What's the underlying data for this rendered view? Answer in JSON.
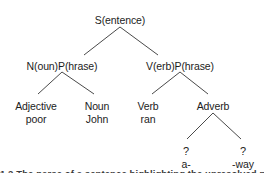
{
  "diagram": {
    "type": "syntax-parse-tree",
    "title": "",
    "colors": {
      "background": "#ffffff",
      "text": "#1c1c1c",
      "edge": "#4a4a4a"
    },
    "nodes": [
      {
        "id": "s",
        "label": "S(entence)",
        "word": "",
        "x": 120,
        "y": 14
      },
      {
        "id": "np",
        "label": "N(oun)P(hrase)",
        "word": "",
        "x": 62,
        "y": 60
      },
      {
        "id": "vp",
        "label": "V(erb)P(hrase)",
        "word": "",
        "x": 180,
        "y": 60
      },
      {
        "id": "adjective",
        "label": "Adjective",
        "word": "poor",
        "x": 36,
        "y": 100
      },
      {
        "id": "noun",
        "label": "Noun",
        "word": "John",
        "x": 97,
        "y": 100
      },
      {
        "id": "verb",
        "label": "Verb",
        "word": "ran",
        "x": 148,
        "y": 100
      },
      {
        "id": "adverb",
        "label": "Adverb",
        "word": "",
        "x": 213,
        "y": 100
      },
      {
        "id": "affix-a",
        "label": "?",
        "word": "a-",
        "x": 186,
        "y": 145
      },
      {
        "id": "affix-way",
        "label": "?",
        "word": "-way",
        "x": 243,
        "y": 145
      }
    ],
    "edges": [
      {
        "from": "s",
        "to": "np",
        "x1": 120,
        "y1": 27,
        "x2": 84,
        "y2": 55
      },
      {
        "from": "s",
        "to": "vp",
        "x1": 120,
        "y1": 27,
        "x2": 158,
        "y2": 55
      },
      {
        "from": "np",
        "to": "adjective",
        "x1": 62,
        "y1": 72,
        "x2": 38,
        "y2": 94
      },
      {
        "from": "np",
        "to": "noun",
        "x1": 62,
        "y1": 72,
        "x2": 94,
        "y2": 94
      },
      {
        "from": "vp",
        "to": "verb",
        "x1": 180,
        "y1": 72,
        "x2": 152,
        "y2": 94
      },
      {
        "from": "vp",
        "to": "adverb",
        "x1": 180,
        "y1": 72,
        "x2": 208,
        "y2": 94
      },
      {
        "from": "adverb",
        "to": "affix-a",
        "x1": 213,
        "y1": 113,
        "x2": 187,
        "y2": 139
      },
      {
        "from": "adverb",
        "to": "affix-way",
        "x1": 213,
        "y1": 113,
        "x2": 241,
        "y2": 139
      }
    ]
  },
  "caption": {
    "text": "1.2  The parse of a sentence highlighting the unresolved parts"
  }
}
